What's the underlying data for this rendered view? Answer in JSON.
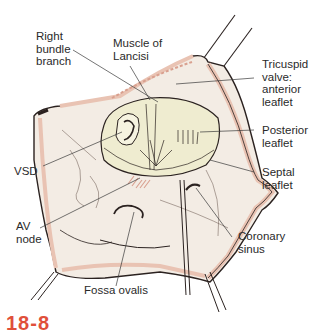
{
  "figure": {
    "number": "18-8",
    "number_color": "#e0503a"
  },
  "colors": {
    "wall_fill": "#f3ece4",
    "wall_edge": "#e9c3b3",
    "outline": "#2b2220",
    "valve_fill": "#efecd0",
    "leader_line": "#3a3a3a",
    "muscle_pink": "#d9a08f"
  },
  "labels": {
    "right_bundle_branch": "Right\nbundle\nbranch",
    "muscle_of_lancisi": "Muscle of\nLancisi",
    "tricuspid_anterior": "Tricuspid\nvalve:\nanterior\nleaflet",
    "posterior_leaflet": "Posterior\nleaflet",
    "septal_leaflet": "Septal\nleaflet",
    "vsd": "VSD",
    "av_node": "AV\nnode",
    "coronary_sinus": "Coronary\nsinus",
    "fossa_ovalis": "Fossa ovalis"
  }
}
